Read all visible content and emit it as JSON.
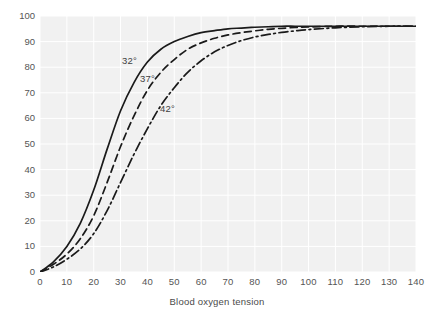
{
  "chart_data": {
    "type": "line",
    "title": "",
    "subtitle": "",
    "xlabel": "Blood oxygen tension",
    "ylabel": "% Hb sat",
    "xlim": [
      0,
      140
    ],
    "ylim": [
      0,
      100
    ],
    "xticks": [
      "0",
      "10",
      "20",
      "30",
      "40",
      "50",
      "60",
      "70",
      "80",
      "90",
      "100",
      "110",
      "120",
      "130",
      "140"
    ],
    "yticks": [
      "0",
      "10",
      "20",
      "30",
      "40",
      "50",
      "60",
      "70",
      "80",
      "90",
      "100"
    ],
    "grid": true,
    "legend_position": "inline-annotations",
    "background": "#f1f1f1",
    "line_color": "#1a1a1a",
    "series": [
      {
        "name": "32°",
        "label": "32°",
        "style": "solid",
        "x": [
          0,
          5,
          10,
          15,
          20,
          25,
          30,
          35,
          40,
          45,
          50,
          55,
          60,
          65,
          70,
          75,
          80,
          85,
          90,
          95,
          100,
          110,
          120,
          130,
          140
        ],
        "values": [
          0,
          4,
          10,
          19,
          32,
          48,
          63,
          74,
          82,
          87,
          90,
          92,
          93.5,
          94.3,
          95,
          95.3,
          95.6,
          95.8,
          96,
          96,
          96,
          96,
          96,
          96,
          96
        ]
      },
      {
        "name": "37°",
        "label": "37°",
        "style": "dashed",
        "x": [
          0,
          5,
          10,
          15,
          20,
          25,
          30,
          35,
          40,
          45,
          50,
          55,
          60,
          65,
          70,
          75,
          80,
          85,
          90,
          95,
          100,
          110,
          120,
          130,
          140
        ],
        "values": [
          0,
          3,
          7,
          13,
          22,
          35,
          49,
          61,
          71,
          78,
          83,
          87,
          89.5,
          91.3,
          92.6,
          93.5,
          94.2,
          94.8,
          95.2,
          95.5,
          95.7,
          96,
          96,
          96,
          96
        ]
      },
      {
        "name": "42°",
        "label": "42°",
        "style": "dashdot",
        "x": [
          0,
          5,
          10,
          15,
          20,
          25,
          30,
          35,
          40,
          45,
          50,
          55,
          60,
          65,
          70,
          75,
          80,
          85,
          90,
          95,
          100,
          110,
          120,
          130,
          140
        ],
        "values": [
          0,
          2,
          5,
          9,
          15,
          24,
          35,
          46,
          56,
          65,
          72,
          78,
          82.5,
          86,
          88.5,
          90.4,
          91.8,
          92.8,
          93.6,
          94.2,
          94.7,
          95.4,
          95.8,
          96,
          96
        ]
      }
    ],
    "annotations": [
      {
        "text": "32°",
        "x_px": 122,
        "y_px": 55
      },
      {
        "text": "37°",
        "x_px": 140,
        "y_px": 73
      },
      {
        "text": "42°",
        "x_px": 160,
        "y_px": 103
      }
    ]
  }
}
